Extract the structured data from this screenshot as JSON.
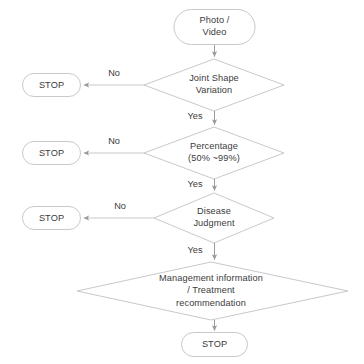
{
  "diagram": {
    "colors": {
      "stroke": "#c9c9cc",
      "text": "#3b3b3b",
      "background": "#ffffff",
      "arrow": "#9a9a9d"
    },
    "nodes": [
      {
        "id": "start",
        "type": "terminal",
        "label": "Photo /\nVideo"
      },
      {
        "id": "joint-shape-variation",
        "type": "decision",
        "label": "Joint Shape\nVariation"
      },
      {
        "id": "stop-1",
        "type": "terminal",
        "label": "STOP"
      },
      {
        "id": "percentage",
        "type": "decision",
        "label": "Percentage\n(50% ~99%)"
      },
      {
        "id": "stop-2",
        "type": "terminal",
        "label": "STOP"
      },
      {
        "id": "disease-judgment",
        "type": "decision",
        "label": "Disease\nJudgment"
      },
      {
        "id": "stop-3",
        "type": "terminal",
        "label": "STOP"
      },
      {
        "id": "management-treatment",
        "type": "decision",
        "label": "Management information\n/ Treatment\nrecommendation"
      },
      {
        "id": "stop-final",
        "type": "terminal",
        "label": "STOP"
      }
    ],
    "edges": [
      {
        "id": "e1",
        "from": "start",
        "to": "joint-shape-variation",
        "label": ""
      },
      {
        "id": "e2",
        "from": "joint-shape-variation",
        "to": "stop-1",
        "label": "No"
      },
      {
        "id": "e3",
        "from": "joint-shape-variation",
        "to": "percentage",
        "label": "Yes"
      },
      {
        "id": "e4",
        "from": "percentage",
        "to": "stop-2",
        "label": "No"
      },
      {
        "id": "e5",
        "from": "percentage",
        "to": "disease-judgment",
        "label": "Yes"
      },
      {
        "id": "e6",
        "from": "disease-judgment",
        "to": "stop-3",
        "label": "No"
      },
      {
        "id": "e7",
        "from": "disease-judgment",
        "to": "management-treatment",
        "label": "Yes"
      },
      {
        "id": "e8",
        "from": "management-treatment",
        "to": "stop-final",
        "label": ""
      }
    ]
  }
}
